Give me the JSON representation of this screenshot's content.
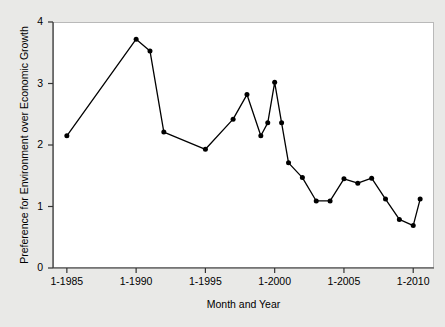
{
  "chart_data": {
    "type": "line",
    "title": "",
    "xlabel": "Month and Year",
    "ylabel": "Preference for Environment over Economic Growth",
    "xlim": [
      1984.0,
      2011.5
    ],
    "ylim": [
      0,
      4
    ],
    "grid": false,
    "legend": null,
    "marker": "filled-circle",
    "line_color": "#000000",
    "marker_color": "#000000",
    "background_color": "#e9e9e7",
    "panel_color": "#ffffff",
    "xticks": [
      {
        "value": 1985,
        "label": "1-1985"
      },
      {
        "value": 1990,
        "label": "1-1990"
      },
      {
        "value": 1995,
        "label": "1-1995"
      },
      {
        "value": 2000,
        "label": "1-2000"
      },
      {
        "value": 2005,
        "label": "1-2005"
      },
      {
        "value": 2010,
        "label": "1-2010"
      }
    ],
    "yticks": [
      {
        "value": 0,
        "label": "0"
      },
      {
        "value": 1,
        "label": "1"
      },
      {
        "value": 2,
        "label": "2"
      },
      {
        "value": 3,
        "label": "3"
      },
      {
        "value": 4,
        "label": "4"
      }
    ],
    "x": [
      1985.0,
      1990.0,
      1991.0,
      1992.0,
      1995.0,
      1997.0,
      1998.0,
      1999.0,
      1999.5,
      2000.0,
      2000.5,
      2001.0,
      2002.0,
      2003.0,
      2004.0,
      2005.0,
      2006.0,
      2007.0,
      2008.0,
      2009.0,
      2010.0,
      2010.5
    ],
    "values": [
      2.15,
      3.72,
      3.53,
      2.21,
      1.93,
      2.42,
      2.82,
      2.15,
      2.36,
      3.02,
      2.36,
      1.71,
      1.47,
      1.09,
      1.09,
      1.45,
      1.38,
      1.46,
      1.12,
      0.79,
      0.69,
      1.12
    ],
    "point_labels": [
      "1-1985",
      "1-1990",
      "1-1991",
      "1-1992",
      "1-1995",
      "1-1997",
      "1-1998",
      "1-1999",
      "6-1999",
      "1-2000",
      "6-2000",
      "1-2001",
      "1-2002",
      "1-2003",
      "1-2004",
      "1-2005",
      "1-2006",
      "1-2007",
      "1-2008",
      "1-2009",
      "1-2010",
      "6-2010"
    ]
  }
}
